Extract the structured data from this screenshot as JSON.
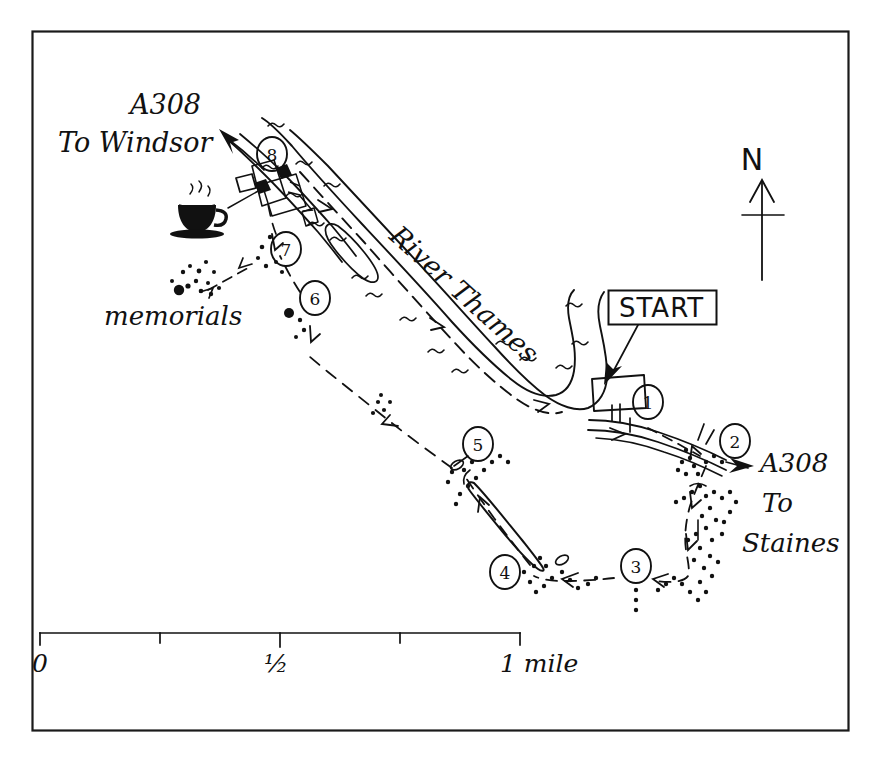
{
  "map": {
    "title": "Runnymede circular walk sketch map",
    "frame_color": "#1a1a1a",
    "ink_color": "#111111",
    "paper_color": "#ffffff",
    "river_label": "River Thames",
    "start_label": "START",
    "memorials_label": "memorials",
    "north_label": "N",
    "road_northwest": {
      "road_number": "A308",
      "direction_line1": "To Windsor"
    },
    "road_southeast": {
      "road_number": "A308",
      "direction_line1": "To",
      "direction_line2": "Staines"
    },
    "cafe_icon_name": "coffee-cup-icon",
    "waypoints": [
      {
        "id": 1,
        "label": "1",
        "cx": 648,
        "cy": 402
      },
      {
        "id": 2,
        "label": "2",
        "cx": 735,
        "cy": 441
      },
      {
        "id": 3,
        "label": "3",
        "cx": 636,
        "cy": 566
      },
      {
        "id": 4,
        "label": "4",
        "cx": 505,
        "cy": 572
      },
      {
        "id": 5,
        "label": "5",
        "cx": 478,
        "cy": 444
      },
      {
        "id": 6,
        "label": "6",
        "cx": 315,
        "cy": 298
      },
      {
        "id": 7,
        "label": "7",
        "cx": 286,
        "cy": 249
      },
      {
        "id": 8,
        "label": "8",
        "cx": 272,
        "cy": 154
      }
    ],
    "scale_bar": {
      "start_label": "0",
      "mid_label": "½",
      "end_label": "1 mile",
      "ticks": [
        0,
        0.25,
        0.5,
        0.75,
        1
      ],
      "units": "mile",
      "x_start": 40,
      "x_end": 520,
      "y": 633
    }
  }
}
